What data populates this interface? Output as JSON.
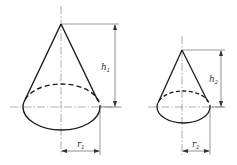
{
  "figure": {
    "type": "technical drawing",
    "colors": {
      "outline": "#1a1a1a",
      "dimension": "#444444",
      "centerline": "#666666",
      "background": "#ffffff"
    }
  },
  "cones": [
    {
      "id": 1,
      "height_label": "h",
      "height_sub": "1",
      "radius_label": "r",
      "radius_sub": "1"
    },
    {
      "id": 2,
      "height_label": "h",
      "height_sub": "2",
      "radius_label": "r",
      "radius_sub": "2"
    }
  ]
}
